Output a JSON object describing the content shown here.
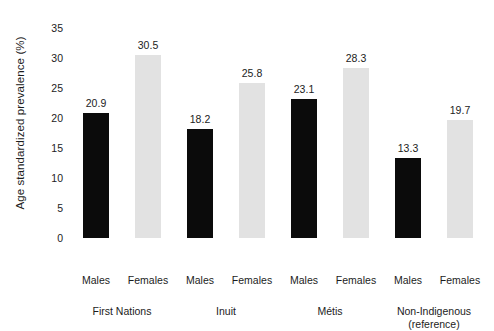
{
  "chart_data": {
    "type": "bar",
    "title": "",
    "xlabel": "",
    "ylabel": "Age standardized prevalence (%)",
    "ylim": [
      0,
      35
    ],
    "yticks": [
      0,
      5,
      10,
      15,
      20,
      25,
      30,
      35
    ],
    "ytick_labels": [
      "0",
      "5",
      "10",
      "15",
      "20",
      "25",
      "30",
      "35"
    ],
    "grid": false,
    "legend": "none",
    "categories": [
      "First Nations",
      "Inuit",
      "Métis",
      "Non-Indigenous (reference)"
    ],
    "group_labels": [
      {
        "line1": "First Nations",
        "line2": ""
      },
      {
        "line1": "Inuit",
        "line2": ""
      },
      {
        "line1": "Métis",
        "line2": ""
      },
      {
        "line1": "Non-Indigenous",
        "line2": "(reference)"
      }
    ],
    "series": [
      {
        "name": "Males",
        "color": "#0b0b0b",
        "values": [
          20.9,
          18.2,
          23.1,
          13.3
        ],
        "value_labels": [
          "20.9",
          "18.2",
          "23.1",
          "13.3"
        ]
      },
      {
        "name": "Females",
        "color": "#e2e2e2",
        "values": [
          30.5,
          25.8,
          28.3,
          19.7
        ],
        "value_labels": [
          "30.5",
          "25.8",
          "28.3",
          "19.7"
        ]
      }
    ],
    "bars": [
      {
        "group": "First Nations",
        "sex": "Males",
        "value": 20.9,
        "label": "20.9",
        "style": "males"
      },
      {
        "group": "First Nations",
        "sex": "Females",
        "value": 30.5,
        "label": "30.5",
        "style": "females"
      },
      {
        "group": "Inuit",
        "sex": "Males",
        "value": 18.2,
        "label": "18.2",
        "style": "males"
      },
      {
        "group": "Inuit",
        "sex": "Females",
        "value": 25.8,
        "label": "25.8",
        "style": "females"
      },
      {
        "group": "Métis",
        "sex": "Males",
        "value": 23.1,
        "label": "23.1",
        "style": "males"
      },
      {
        "group": "Métis",
        "sex": "Females",
        "value": 28.3,
        "label": "28.3",
        "style": "females"
      },
      {
        "group": "Non-Indigenous",
        "sex": "Males",
        "value": 13.3,
        "label": "13.3",
        "style": "males"
      },
      {
        "group": "Non-Indigenous",
        "sex": "Females",
        "value": 19.7,
        "label": "19.7",
        "style": "females"
      }
    ],
    "sex_labels": [
      "Males",
      "Females",
      "Males",
      "Females",
      "Males",
      "Females",
      "Males",
      "Females"
    ],
    "colors": {
      "males": "#0b0b0b",
      "females": "#e2e2e2",
      "text": "#1c1c1c",
      "background": "#ffffff"
    }
  }
}
